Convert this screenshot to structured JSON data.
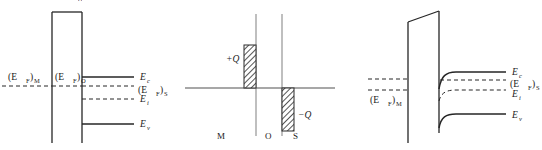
{
  "figure": {
    "title": "",
    "width": 542,
    "height": 150,
    "background": "#ffffff",
    "line_color": "#262626",
    "axis_color": "#8a8a8a",
    "hatch_color": "#2b2b2b",
    "clipped_top_glyph": "δ"
  },
  "panel_left": {
    "name": "mos-flat-band-equilibrium",
    "labels": {
      "ef_metal": "(E",
      "ef_metal_sub": "F",
      "ef_metal_close": ")",
      "ef_metal_region": "M",
      "ef_oxide": "(E",
      "ef_oxide_sub": "F",
      "ef_oxide_close": ")",
      "ef_oxide_region": "O",
      "ec": "E",
      "ec_sub": "c",
      "ef_semi": "(E",
      "ef_semi_sub": "F",
      "ef_semi_close": ")",
      "ef_semi_region": "S",
      "ei": "E",
      "ei_sub": "i",
      "ev": "E",
      "ev_sub": "v"
    }
  },
  "panel_middle": {
    "name": "charge-distribution",
    "labels": {
      "positive_charge": "+Q",
      "negative_charge": "−Q",
      "region_metal": "M",
      "region_oxide": "O",
      "region_semiconductor": "S"
    },
    "charge_blocks": [
      {
        "name": "metal-sheet-charge",
        "sign": "positive",
        "label": "+Q"
      },
      {
        "name": "semiconductor-depletion-charge",
        "sign": "negative",
        "label": "−Q"
      }
    ]
  },
  "panel_right": {
    "name": "mos-band-bending-depletion",
    "labels": {
      "ef_metal": "(E",
      "ef_metal_sub": "F",
      "ef_metal_close": ")",
      "ef_metal_region": "M",
      "ec": "E",
      "ec_sub": "c",
      "ef_semi": "(E",
      "ef_semi_sub": "F",
      "ef_semi_close": ")",
      "ef_semi_region": "S",
      "ei": "E",
      "ei_sub": "i",
      "ev": "E",
      "ev_sub": "v"
    }
  }
}
